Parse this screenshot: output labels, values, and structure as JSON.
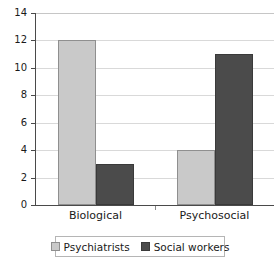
{
  "chart_data": {
    "type": "bar",
    "title": "",
    "subtitle": "",
    "xlabel": "",
    "ylabel": "",
    "categories": [
      "Biological",
      "Psychosocial"
    ],
    "series": [
      {
        "name": "Psychiatrists",
        "values": [
          12,
          4
        ],
        "color": "#c9c9c9"
      },
      {
        "name": "Social workers",
        "values": [
          3,
          11
        ],
        "color": "#4b4b4b"
      }
    ],
    "ylim": [
      0,
      14
    ],
    "ytick_step": 2,
    "yticks": [
      0,
      2,
      4,
      6,
      8,
      10,
      12,
      14
    ],
    "ytick_labels": [
      "0",
      "2",
      "4",
      "6",
      "8",
      "10",
      "12",
      "14"
    ],
    "grid": "horizontal",
    "grid_color": "#d9d9d9",
    "legend_position": "bottom",
    "legend_border_color": "#b5b5b5",
    "axis_color": "#4a4a4a",
    "background": "#ffffff"
  }
}
